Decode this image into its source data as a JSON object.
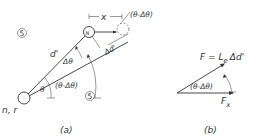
{
  "figure": {
    "panel_a": {
      "caption": "(a)",
      "origin_label": "n, r",
      "region_label_top": "5",
      "region_label_bottom": "5",
      "labels": {
        "d_prime": "d'",
        "delta_theta": "Δθ",
        "theta": "θ",
        "theta_minus_delta": "(θ-Δθ)",
        "x": "x",
        "delta_d_prime": "Δd'",
        "top_angle": "(θ-Δθ)",
        "moving_node": "N"
      }
    },
    "panel_b": {
      "caption": "(b)",
      "force_label": "F = L",
      "force_subscript": "e",
      "force_suffix": "Δd'",
      "angle_label": "(θ-Δθ)",
      "component_label": "F",
      "component_subscript": "x"
    }
  }
}
